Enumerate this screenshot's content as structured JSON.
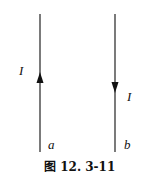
{
  "diagram": {
    "wires": [
      {
        "name": "a",
        "current_label": "I",
        "direction": "up"
      },
      {
        "name": "b",
        "current_label": "I",
        "direction": "down"
      }
    ],
    "caption": "图 12. 3-11"
  }
}
